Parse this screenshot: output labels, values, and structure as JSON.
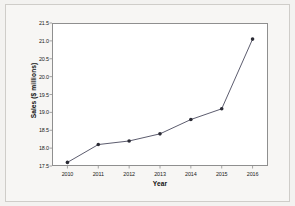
{
  "chart_data": {
    "type": "line",
    "title": "",
    "xlabel": "Year",
    "ylabel": "Sales ($ millions)",
    "categories": [
      "2010",
      "2011",
      "2012",
      "2013",
      "2014",
      "2015",
      "2016"
    ],
    "x": [
      2010,
      2011,
      2012,
      2013,
      2014,
      2015,
      2016
    ],
    "values": [
      17.6,
      18.1,
      18.2,
      18.4,
      18.8,
      19.1,
      21.05
    ],
    "series": [
      {
        "name": "Sales",
        "values": [
          17.6,
          18.1,
          18.2,
          18.4,
          18.8,
          19.1,
          21.05
        ]
      }
    ],
    "ylim": [
      17.5,
      21.5
    ],
    "yticks": [
      17.5,
      18.0,
      18.5,
      19.0,
      19.5,
      20.0,
      20.5,
      21.0,
      21.5
    ],
    "ytick_labels": [
      "17.5",
      "18.0",
      "18.5",
      "19.0",
      "19.5",
      "20.0",
      "20.5",
      "21.0",
      "21.5"
    ],
    "xtick_labels": [
      "2010",
      "2011",
      "2012",
      "2013",
      "2014",
      "2015",
      "2016"
    ],
    "grid": false,
    "legend": false,
    "legend_position": "none",
    "marker": "circle",
    "line_color": "#4a4a5e",
    "marker_color": "#2b2b35",
    "plot_background": "#ffffff",
    "figure_background": "#f7f6f4",
    "axis_color": "#8f8f8f"
  }
}
